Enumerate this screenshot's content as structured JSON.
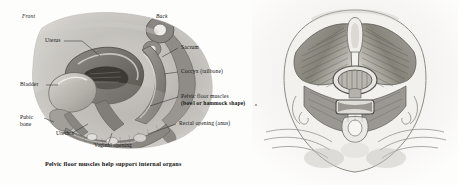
{
  "figure": {
    "caption": "Pelvic floor muscles help support internal organs"
  },
  "panels": {
    "sagittal": {
      "name": "female-pelvis-sagittal-view",
      "orientation": {
        "front": "Front",
        "back": "Back"
      },
      "labels": [
        {
          "id": "uterus",
          "text": "Uterus",
          "side": "top"
        },
        {
          "id": "sacrum",
          "text": "Sacrum",
          "side": "right"
        },
        {
          "id": "coccyx",
          "text": "Coccyx (tailbone)",
          "side": "right"
        },
        {
          "id": "pelvic-floor-line-1",
          "text": "Pelvic floor muscles",
          "side": "right"
        },
        {
          "id": "pelvic-floor-line-2",
          "text": "(bowl or hammock shape)",
          "side": "right"
        },
        {
          "id": "rectal-opening",
          "text": "Rectal opening (anus)",
          "side": "right"
        },
        {
          "id": "bladder",
          "text": "Bladder",
          "side": "left"
        },
        {
          "id": "pubic-bone-line-1",
          "text": "Pubic",
          "side": "left"
        },
        {
          "id": "pubic-bone-line-2",
          "text": "bone",
          "side": "left"
        },
        {
          "id": "urethra",
          "text": "Urethra",
          "side": "bottom"
        },
        {
          "id": "vaginal-opening",
          "text": "Vaginal opening",
          "side": "bottom"
        }
      ]
    },
    "inferior": {
      "name": "pelvic-floor-muscles-inferior-view",
      "labels": []
    }
  },
  "colors": {
    "background": "#fdfdfc",
    "ink": "#141414",
    "leader_line": "#3a3a3a",
    "tissue_mid": "#9a9793",
    "tissue_dark": "#5e5b57",
    "tissue_light": "#d6d3cd"
  }
}
